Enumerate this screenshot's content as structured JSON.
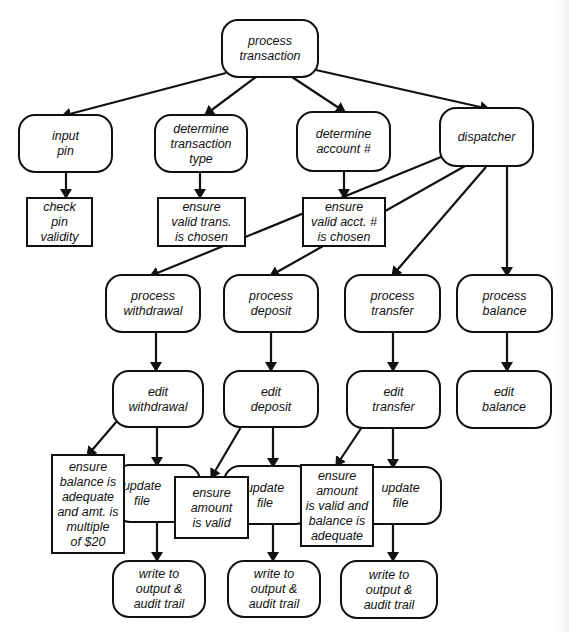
{
  "diagram": {
    "colors": {
      "stroke": "#111111",
      "fill": "#ffffff",
      "background": "#ffffff"
    },
    "nodes": [
      {
        "id": "process-transaction",
        "shape": "rounded",
        "x": 222,
        "y": 20,
        "w": 96,
        "h": 57,
        "lines": [
          "process",
          "transaction"
        ]
      },
      {
        "id": "input-pin",
        "shape": "rounded",
        "x": 19,
        "y": 115,
        "w": 93,
        "h": 57,
        "lines": [
          "input",
          "pin"
        ]
      },
      {
        "id": "determine-transaction-type",
        "shape": "rounded",
        "x": 155,
        "y": 115,
        "w": 92,
        "h": 57,
        "lines": [
          "determine",
          "transaction",
          "type"
        ]
      },
      {
        "id": "determine-account",
        "shape": "rounded",
        "x": 297,
        "y": 112,
        "w": 93,
        "h": 59,
        "lines": [
          "determine",
          "account #"
        ]
      },
      {
        "id": "dispatcher",
        "shape": "rounded",
        "x": 440,
        "y": 108,
        "w": 93,
        "h": 58,
        "lines": [
          "dispatcher"
        ]
      },
      {
        "id": "check-pin-validity",
        "shape": "rect",
        "x": 27,
        "y": 198,
        "w": 65,
        "h": 48,
        "lines": [
          "check",
          "pin",
          "validity"
        ]
      },
      {
        "id": "ensure-valid-trans",
        "shape": "rect",
        "x": 158,
        "y": 198,
        "w": 87,
        "h": 48,
        "lines": [
          "ensure",
          "valid trans.",
          "is chosen"
        ]
      },
      {
        "id": "ensure-valid-acct",
        "shape": "rect",
        "x": 303,
        "y": 198,
        "w": 82,
        "h": 48,
        "lines": [
          "ensure",
          "valid acct. #",
          "is chosen"
        ]
      },
      {
        "id": "process-withdrawal",
        "shape": "rounded",
        "x": 106,
        "y": 275,
        "w": 94,
        "h": 57,
        "lines": [
          "process",
          "withdrawal"
        ]
      },
      {
        "id": "process-deposit",
        "shape": "rounded",
        "x": 224,
        "y": 275,
        "w": 94,
        "h": 57,
        "lines": [
          "process",
          "deposit"
        ]
      },
      {
        "id": "process-transfer",
        "shape": "rounded",
        "x": 345,
        "y": 275,
        "w": 95,
        "h": 57,
        "lines": [
          "process",
          "transfer"
        ]
      },
      {
        "id": "process-balance",
        "shape": "rounded",
        "x": 457,
        "y": 275,
        "w": 95,
        "h": 57,
        "lines": [
          "process",
          "balance"
        ]
      },
      {
        "id": "edit-withdrawal",
        "shape": "rounded",
        "x": 113,
        "y": 371,
        "w": 90,
        "h": 56,
        "lines": [
          "edit",
          "withdrawal"
        ]
      },
      {
        "id": "edit-deposit",
        "shape": "rounded",
        "x": 224,
        "y": 371,
        "w": 94,
        "h": 56,
        "lines": [
          "edit",
          "deposit"
        ]
      },
      {
        "id": "edit-transfer",
        "shape": "rounded",
        "x": 347,
        "y": 371,
        "w": 93,
        "h": 57,
        "lines": [
          "edit",
          "transfer"
        ]
      },
      {
        "id": "edit-balance",
        "shape": "rounded",
        "x": 457,
        "y": 371,
        "w": 94,
        "h": 57,
        "lines": [
          "edit",
          "balance"
        ]
      },
      {
        "id": "update-file-withdrawal",
        "shape": "rounded",
        "x": 114,
        "y": 465,
        "w": 86,
        "h": 57,
        "lines": [
          "update",
          "file"
        ],
        "textOffsetX": -15
      },
      {
        "id": "update-file-deposit",
        "shape": "rounded",
        "x": 224,
        "y": 466,
        "w": 88,
        "h": 58,
        "lines": [
          "update",
          "file"
        ],
        "textOffsetX": -3
      },
      {
        "id": "update-file-transfer",
        "shape": "rounded",
        "x": 340,
        "y": 467,
        "w": 101,
        "h": 57,
        "lines": [
          "update",
          "file"
        ],
        "textOffsetX": 10
      },
      {
        "id": "ensure-balance-adequate",
        "shape": "rect",
        "x": 52,
        "y": 455,
        "w": 72,
        "h": 98,
        "lines": [
          "ensure",
          "balance is",
          "adequate",
          "and amt. is",
          "multiple",
          "of $20"
        ]
      },
      {
        "id": "ensure-amount-valid",
        "shape": "rect",
        "x": 175,
        "y": 477,
        "w": 73,
        "h": 61,
        "lines": [
          "ensure",
          "amount",
          "is valid"
        ]
      },
      {
        "id": "ensure-amount-valid-balance",
        "shape": "rect",
        "x": 301,
        "y": 465,
        "w": 72,
        "h": 81,
        "lines": [
          "ensure",
          "amount",
          "is valid and",
          "balance is",
          "adequate"
        ]
      },
      {
        "id": "write-output-withdrawal",
        "shape": "rounded",
        "x": 113,
        "y": 561,
        "w": 92,
        "h": 56,
        "lines": [
          "write to",
          "output &",
          "audit trail"
        ]
      },
      {
        "id": "write-output-deposit",
        "shape": "rounded",
        "x": 228,
        "y": 561,
        "w": 92,
        "h": 56,
        "lines": [
          "write to",
          "output &",
          "audit trail"
        ]
      },
      {
        "id": "write-output-transfer",
        "shape": "rounded",
        "x": 341,
        "y": 561,
        "w": 96,
        "h": 57,
        "lines": [
          "write to",
          "output &",
          "audit trail"
        ]
      }
    ],
    "edges": [
      {
        "from": "process-transaction",
        "to": "input-pin",
        "points": [
          [
            226,
            73
          ],
          [
            62,
            116
          ]
        ]
      },
      {
        "from": "process-transaction",
        "to": "determine-transaction-type",
        "points": [
          [
            256,
            77
          ],
          [
            205,
            115
          ]
        ]
      },
      {
        "from": "process-transaction",
        "to": "determine-account",
        "points": [
          [
            292,
            77
          ],
          [
            345,
            112
          ]
        ]
      },
      {
        "from": "process-transaction",
        "to": "dispatcher",
        "points": [
          [
            316,
            70
          ],
          [
            489,
            109
          ]
        ]
      },
      {
        "from": "input-pin",
        "to": "check-pin-validity",
        "points": [
          [
            66,
            172
          ],
          [
            66,
            198
          ]
        ]
      },
      {
        "from": "determine-transaction-type",
        "to": "ensure-valid-trans",
        "points": [
          [
            200,
            172
          ],
          [
            200,
            198
          ]
        ]
      },
      {
        "from": "determine-account",
        "to": "ensure-valid-acct",
        "points": [
          [
            344,
            171
          ],
          [
            344,
            198
          ]
        ]
      },
      {
        "from": "dispatcher",
        "to": "process-withdrawal",
        "points": [
          [
            441,
            157
          ],
          [
            150,
            276
          ]
        ]
      },
      {
        "from": "dispatcher",
        "to": "process-deposit",
        "points": [
          [
            465,
            166
          ],
          [
            270,
            276
          ]
        ]
      },
      {
        "from": "dispatcher",
        "to": "process-transfer",
        "points": [
          [
            486,
            167
          ],
          [
            392,
            276
          ]
        ]
      },
      {
        "from": "dispatcher",
        "to": "process-balance",
        "points": [
          [
            507,
            166
          ],
          [
            507,
            276
          ]
        ]
      },
      {
        "from": "process-withdrawal",
        "to": "edit-withdrawal",
        "points": [
          [
            156,
            332
          ],
          [
            156,
            371
          ]
        ]
      },
      {
        "from": "process-deposit",
        "to": "edit-deposit",
        "points": [
          [
            271,
            332
          ],
          [
            271,
            371
          ]
        ]
      },
      {
        "from": "process-transfer",
        "to": "edit-transfer",
        "points": [
          [
            393,
            332
          ],
          [
            393,
            371
          ]
        ]
      },
      {
        "from": "process-balance",
        "to": "edit-balance",
        "points": [
          [
            507,
            332
          ],
          [
            507,
            371
          ]
        ]
      },
      {
        "from": "edit-withdrawal",
        "to": "ensure-balance-adequate",
        "points": [
          [
            117,
            421
          ],
          [
            87,
            456
          ]
        ]
      },
      {
        "from": "edit-withdrawal",
        "to": "update-file-withdrawal",
        "points": [
          [
            157,
            427
          ],
          [
            157,
            466
          ]
        ]
      },
      {
        "from": "edit-deposit",
        "to": "ensure-amount-valid",
        "points": [
          [
            241,
            427
          ],
          [
            211,
            478
          ]
        ]
      },
      {
        "from": "edit-deposit",
        "to": "update-file-deposit",
        "points": [
          [
            273,
            427
          ],
          [
            273,
            467
          ]
        ]
      },
      {
        "from": "edit-transfer",
        "to": "ensure-amount-valid-balance",
        "points": [
          [
            362,
            427
          ],
          [
            336,
            466
          ]
        ]
      },
      {
        "from": "edit-transfer",
        "to": "update-file-transfer",
        "points": [
          [
            393,
            428
          ],
          [
            393,
            468
          ]
        ]
      },
      {
        "from": "update-file-withdrawal",
        "to": "write-output-withdrawal",
        "points": [
          [
            157,
            522
          ],
          [
            157,
            561
          ]
        ]
      },
      {
        "from": "update-file-deposit",
        "to": "write-output-deposit",
        "points": [
          [
            273,
            524
          ],
          [
            273,
            561
          ]
        ]
      },
      {
        "from": "update-file-transfer",
        "to": "write-output-transfer",
        "points": [
          [
            393,
            524
          ],
          [
            393,
            561
          ]
        ]
      }
    ]
  }
}
